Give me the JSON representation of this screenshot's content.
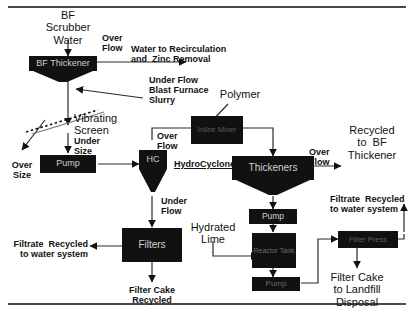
{
  "diagram": {
    "type": "process-flow-diagram",
    "colors": {
      "equipment_fill": "#111111",
      "equipment_text": "#cfcfcf",
      "line": "#333333",
      "background": "#ffffff",
      "rule": "#4a4a4a"
    },
    "inputs": {
      "feed": "BF\nScrubber\nWater",
      "polymer": "Polymer",
      "hydrated_lime": "Hydrated\nLime"
    },
    "equipment": [
      {
        "id": "bf-thickener",
        "label": "BF Thickener",
        "shape": "thickener"
      },
      {
        "id": "vibrating-screen",
        "label": "Vibrating\nScreen",
        "shape": "screen"
      },
      {
        "id": "pump-screen",
        "label": "Pump",
        "shape": "rect"
      },
      {
        "id": "hydrocyclone",
        "label": "HC",
        "shape": "cyclone"
      },
      {
        "id": "inline-mixer",
        "label": "Inline Mixer",
        "shape": "rect"
      },
      {
        "id": "thickeners",
        "label": "Thickeners",
        "shape": "thickener"
      },
      {
        "id": "pump-thickener",
        "label": "Pump",
        "shape": "rect"
      },
      {
        "id": "reactor-tank",
        "label": "Reactor\nTank",
        "shape": "rect"
      },
      {
        "id": "pump-reactor",
        "label": "Pump",
        "shape": "rect"
      },
      {
        "id": "filters",
        "label": "Filters",
        "shape": "rect"
      },
      {
        "id": "filter-press",
        "label": "Filter Press",
        "shape": "rect"
      }
    ],
    "stream_labels": {
      "over_flow_1": "Over\nFlow",
      "over_flow_2": "Over\nFlow",
      "over_flow_3": "Over\nFlow",
      "under_flow_1": "Under Flow\nBlast Furnace\nSlurry",
      "under_flow_2": "Under\nFlow",
      "over_size": "Over\nSize",
      "under_size": "Under\nSize"
    },
    "outputs": {
      "water_recirc": "Water to Recirculation\nand  Zinc Removal",
      "recycled_bf": "Recycled\nto  BF\nThickener",
      "filtrate_left": "Filtrate  Recycled\nto water system",
      "filtrate_right": "Filtrate  Recycled\nto water system",
      "filter_cake_recycled": "Filter Cake\nRecycled",
      "filter_cake_landfill": "Filter Cake\nto Landfill\nDisposal"
    },
    "annotations": {
      "hydrocyclones": "HydroCyclones"
    }
  }
}
